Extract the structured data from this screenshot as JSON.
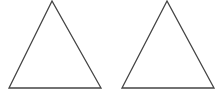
{
  "diagram": {
    "background": "#ffffff",
    "stroke_color": "#444444",
    "shapes": [
      {
        "type": "triangle",
        "name": "left-triangle",
        "points": [
          [
            52,
            1
          ],
          [
            9,
            88
          ],
          [
            101,
            88
          ]
        ]
      },
      {
        "type": "triangle",
        "name": "right-triangle",
        "points": [
          [
            167,
            1
          ],
          [
            122,
            88
          ],
          [
            214,
            88
          ]
        ]
      }
    ]
  }
}
